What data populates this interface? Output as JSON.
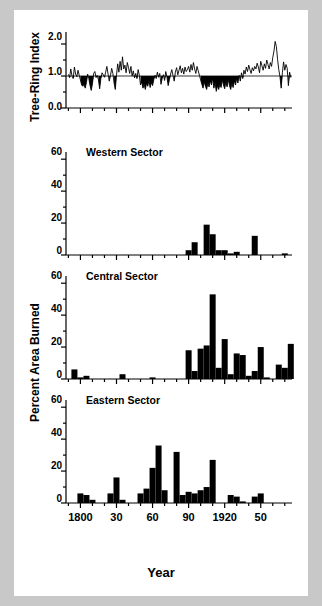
{
  "figure": {
    "xlabel": "Year",
    "ylabel_top": "Tree-Ring Index",
    "ylabel_bottom": "Percent Area Burned",
    "xticklabels": [
      "1800",
      "30",
      "60",
      "90",
      "1920",
      "50"
    ],
    "xtickvalues": [
      1800,
      1830,
      1860,
      1890,
      1920,
      1950
    ],
    "xlim": [
      1788,
      1976
    ],
    "colors": {
      "ink": "#000000",
      "page": "#ffffff",
      "surround": "#c8c8c8"
    }
  },
  "panels": [
    {
      "id": "tree-ring-index",
      "title": "",
      "yticklabels": [
        "0.0",
        "1.0",
        "2.0"
      ],
      "ytickvalues": [
        0.0,
        1.0,
        2.0
      ],
      "ylim": [
        0.0,
        2.25
      ]
    },
    {
      "id": "western-sector",
      "title": "Western Sector",
      "yticklabels": [
        "0",
        "20",
        "40",
        "60"
      ],
      "ytickvalues": [
        0,
        20,
        40,
        60
      ],
      "ylim": [
        0,
        62
      ]
    },
    {
      "id": "central-sector",
      "title": "Central Sector",
      "yticklabels": [
        "0",
        "20",
        "40",
        "60"
      ],
      "ytickvalues": [
        0,
        20,
        40,
        60
      ],
      "ylim": [
        0,
        62
      ]
    },
    {
      "id": "eastern-sector",
      "title": "Eastern Sector",
      "yticklabels": [
        "0",
        "20",
        "40",
        "60"
      ],
      "ytickvalues": [
        0,
        20,
        40,
        60
      ],
      "ylim": [
        0,
        62
      ]
    }
  ],
  "chart_data": [
    {
      "type": "area",
      "id": "tree-ring-index",
      "title": "Tree-Ring Index",
      "xlabel": "Year",
      "ylabel": "Tree-Ring Index",
      "xlim": [
        1788,
        1976
      ],
      "ylim": [
        0.0,
        2.25
      ],
      "baseline": 1.0,
      "fill_below_baseline": true,
      "grid": false,
      "x": [
        1790,
        1791,
        1792,
        1793,
        1794,
        1795,
        1796,
        1797,
        1798,
        1799,
        1800,
        1801,
        1802,
        1803,
        1804,
        1805,
        1806,
        1807,
        1808,
        1809,
        1810,
        1811,
        1812,
        1813,
        1814,
        1815,
        1816,
        1817,
        1818,
        1819,
        1820,
        1821,
        1822,
        1823,
        1824,
        1825,
        1826,
        1827,
        1828,
        1829,
        1830,
        1831,
        1832,
        1833,
        1834,
        1835,
        1836,
        1837,
        1838,
        1839,
        1840,
        1841,
        1842,
        1843,
        1844,
        1845,
        1846,
        1847,
        1848,
        1849,
        1850,
        1851,
        1852,
        1853,
        1854,
        1855,
        1856,
        1857,
        1858,
        1859,
        1860,
        1861,
        1862,
        1863,
        1864,
        1865,
        1866,
        1867,
        1868,
        1869,
        1870,
        1871,
        1872,
        1873,
        1874,
        1875,
        1876,
        1877,
        1878,
        1879,
        1880,
        1881,
        1882,
        1883,
        1884,
        1885,
        1886,
        1887,
        1888,
        1889,
        1890,
        1891,
        1892,
        1893,
        1894,
        1895,
        1896,
        1897,
        1898,
        1899,
        1900,
        1901,
        1902,
        1903,
        1904,
        1905,
        1906,
        1907,
        1908,
        1909,
        1910,
        1911,
        1912,
        1913,
        1914,
        1915,
        1916,
        1917,
        1918,
        1919,
        1920,
        1921,
        1922,
        1923,
        1924,
        1925,
        1926,
        1927,
        1928,
        1929,
        1930,
        1931,
        1932,
        1933,
        1934,
        1935,
        1936,
        1937,
        1938,
        1939,
        1940,
        1941,
        1942,
        1943,
        1944,
        1945,
        1946,
        1947,
        1948,
        1949,
        1950,
        1951,
        1952,
        1953,
        1954,
        1955,
        1956,
        1957,
        1958,
        1959,
        1960,
        1961,
        1962,
        1963,
        1964,
        1965,
        1966,
        1967,
        1968,
        1969,
        1970,
        1971,
        1972,
        1973,
        1974,
        1975
      ],
      "y": [
        1.05,
        0.95,
        1.22,
        1.0,
        0.92,
        1.28,
        1.06,
        0.98,
        1.18,
        1.02,
        0.88,
        0.72,
        0.68,
        0.74,
        0.62,
        0.8,
        1.06,
        0.92,
        0.7,
        0.55,
        0.76,
        1.08,
        1.14,
        0.95,
        1.02,
        0.88,
        0.6,
        0.92,
        1.1,
        1.04,
        0.96,
        1.12,
        1.3,
        1.06,
        0.84,
        1.02,
        1.24,
        1.08,
        0.78,
        0.58,
        1.02,
        1.38,
        1.12,
        1.46,
        1.18,
        1.6,
        1.22,
        1.34,
        1.1,
        1.42,
        1.26,
        1.08,
        1.3,
        1.0,
        1.16,
        0.94,
        1.08,
        0.92,
        1.2,
        1.02,
        0.72,
        0.82,
        0.62,
        0.74,
        0.58,
        0.78,
        0.68,
        0.86,
        0.64,
        0.8,
        0.7,
        0.88,
        1.02,
        0.92,
        1.12,
        0.96,
        1.08,
        0.74,
        0.92,
        1.04,
        0.86,
        1.14,
        0.96,
        0.7,
        0.88,
        1.06,
        1.2,
        1.02,
        0.84,
        1.12,
        1.26,
        1.04,
        1.18,
        1.32,
        1.1,
        1.24,
        1.06,
        1.28,
        1.14,
        1.2,
        1.3,
        1.12,
        1.36,
        1.18,
        1.42,
        1.22,
        1.08,
        1.3,
        1.16,
        1.02,
        0.88,
        0.74,
        0.62,
        0.82,
        0.68,
        0.58,
        0.78,
        0.66,
        0.86,
        0.72,
        0.94,
        0.62,
        0.8,
        0.52,
        0.7,
        0.58,
        0.74,
        0.64,
        0.88,
        0.72,
        0.6,
        0.82,
        0.66,
        0.9,
        0.7,
        0.58,
        0.78,
        0.64,
        0.86,
        0.72,
        0.94,
        0.78,
        1.02,
        0.84,
        1.1,
        0.92,
        1.18,
        1.06,
        1.28,
        1.14,
        1.34,
        1.2,
        1.08,
        1.26,
        1.16,
        1.3,
        1.22,
        1.4,
        1.28,
        1.1,
        1.46,
        1.32,
        1.18,
        1.38,
        1.24,
        1.5,
        1.36,
        1.22,
        1.42,
        1.3,
        1.58,
        1.78,
        2.08,
        1.92,
        1.52,
        1.2,
        0.98,
        0.62,
        1.1,
        1.44,
        1.18,
        1.36,
        1.24,
        0.7,
        1.12,
        0.95
      ]
    },
    {
      "type": "bar",
      "id": "western-sector",
      "title": "Western Sector",
      "xlabel": "Year",
      "ylabel": "Percent Area Burned",
      "xlim": [
        1788,
        1976
      ],
      "ylim": [
        0,
        62
      ],
      "grid": false,
      "bar_width_years": 5,
      "x": [
        1790,
        1795,
        1800,
        1805,
        1810,
        1815,
        1820,
        1825,
        1830,
        1835,
        1840,
        1845,
        1850,
        1855,
        1860,
        1865,
        1870,
        1875,
        1880,
        1885,
        1890,
        1895,
        1900,
        1905,
        1910,
        1915,
        1920,
        1925,
        1930,
        1935,
        1940,
        1945,
        1950,
        1955,
        1960,
        1965,
        1970,
        1975
      ],
      "y": [
        0,
        0,
        0,
        0,
        0,
        0,
        0,
        0,
        0,
        0,
        0,
        0,
        0,
        0,
        0,
        0,
        0,
        0,
        0,
        0,
        3,
        8,
        0,
        19,
        13,
        3,
        3,
        1,
        2,
        0,
        0,
        12,
        0,
        0,
        0,
        0,
        1,
        0
      ]
    },
    {
      "type": "bar",
      "id": "central-sector",
      "title": "Central Sector",
      "xlabel": "Year",
      "ylabel": "Percent Area Burned",
      "xlim": [
        1788,
        1976
      ],
      "ylim": [
        0,
        62
      ],
      "grid": false,
      "bar_width_years": 5,
      "x": [
        1790,
        1795,
        1800,
        1805,
        1810,
        1815,
        1820,
        1825,
        1830,
        1835,
        1840,
        1845,
        1850,
        1855,
        1860,
        1865,
        1870,
        1875,
        1880,
        1885,
        1890,
        1895,
        1900,
        1905,
        1910,
        1915,
        1920,
        1925,
        1930,
        1935,
        1940,
        1945,
        1950,
        1955,
        1960,
        1965,
        1970,
        1975
      ],
      "y": [
        0,
        6,
        1,
        2,
        0,
        0,
        0,
        0,
        0,
        3,
        0,
        0,
        0,
        0,
        1,
        0,
        0,
        0,
        0,
        0,
        18,
        5,
        19,
        21,
        53,
        7,
        25,
        3,
        16,
        15,
        2,
        5,
        20,
        1,
        0,
        9,
        7,
        22
      ]
    },
    {
      "type": "bar",
      "id": "eastern-sector",
      "title": "Eastern Sector",
      "xlabel": "Year",
      "ylabel": "Percent Area Burned",
      "xlim": [
        1788,
        1976
      ],
      "ylim": [
        0,
        62
      ],
      "grid": false,
      "bar_width_years": 5,
      "x": [
        1790,
        1795,
        1800,
        1805,
        1810,
        1815,
        1820,
        1825,
        1830,
        1835,
        1840,
        1845,
        1850,
        1855,
        1860,
        1865,
        1870,
        1875,
        1880,
        1885,
        1890,
        1895,
        1900,
        1905,
        1910,
        1915,
        1920,
        1925,
        1930,
        1935,
        1940,
        1945,
        1950,
        1955,
        1960,
        1965,
        1970,
        1975
      ],
      "y": [
        0,
        0,
        6,
        5,
        2,
        0,
        0,
        6,
        16,
        2,
        0,
        0,
        6,
        9,
        22,
        36,
        8,
        0,
        32,
        5,
        7,
        6,
        8,
        10,
        27,
        0,
        0,
        5,
        4,
        1,
        0,
        4,
        6,
        0,
        0,
        0,
        0,
        0
      ]
    }
  ]
}
